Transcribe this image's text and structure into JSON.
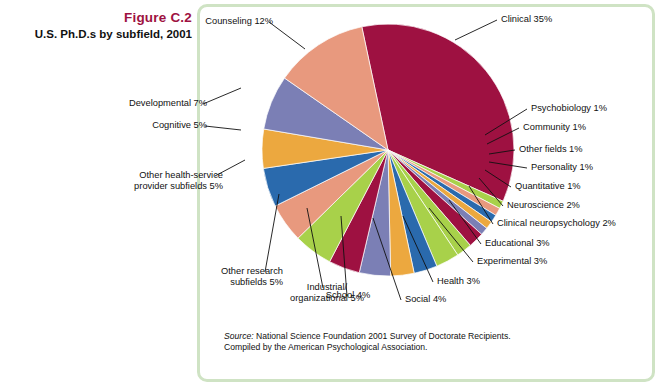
{
  "caption": {
    "figure_number": "Figure C.2",
    "title": "U.S. Ph.D.s by subfield, 2001",
    "figure_number_color": "#9e1141"
  },
  "frame": {
    "border_color": "#cfe3c4"
  },
  "source_note": {
    "label": "Source:",
    "line1": " National Science Foundation 2001 Survey of Doctorate Recipients.",
    "line2": "Compiled by the American Psychological Association."
  },
  "chart_data": {
    "type": "pie",
    "title": "U.S. Ph.D.s by subfield, 2001",
    "xlabel": "",
    "ylabel": "",
    "legend_position": "none",
    "grid": false,
    "start_angle_deg": -12,
    "direction": "clockwise",
    "units": "percent",
    "categories": [
      "Clinical",
      "Psychobiology",
      "Community",
      "Other fields",
      "Personality",
      "Quantitative",
      "Neuroscience",
      "Clinical neuropsychology",
      "Educational",
      "Experimental",
      "Health",
      "Social",
      "School",
      "Industrial/organizational",
      "Other research subfields",
      "Other health-service provider subfields",
      "Cognitive",
      "Developmental",
      "Counseling"
    ],
    "values": [
      35,
      1,
      1,
      1,
      1,
      1,
      2,
      2,
      3,
      3,
      3,
      4,
      4,
      5,
      5,
      5,
      5,
      7,
      12
    ],
    "colors": [
      "#9e1141",
      "#a8d14a",
      "#e8997e",
      "#2a6aad",
      "#eca83f",
      "#7b7fb5",
      "#9e1141",
      "#a8d14a",
      "#a8d14a",
      "#2a6aad",
      "#eca83f",
      "#7b7fb5",
      "#9e1141",
      "#a8d14a",
      "#e8997e",
      "#2a6aad",
      "#eca83f",
      "#7b7fb5",
      "#e8997e"
    ],
    "labels": [
      "Clinical 35%",
      "Psychobiology 1%",
      "Community 1%",
      "Other fields 1%",
      "Personality 1%",
      "Quantitative 1%",
      "Neuroscience 2%",
      "Clinical neuropsychology 2%",
      "Educational 3%",
      "Experimental 3%",
      "Health 3%",
      "Social 4%",
      "School 4%",
      "Industrial/organizational 5%",
      "Other research subfields 5%",
      "Other health-service provider subfields 5%",
      "Cognitive 5%",
      "Developmental 7%",
      "Counseling 12%"
    ]
  },
  "labels": {
    "clinical": "Clinical 35%",
    "psychobiology": "Psychobiology 1%",
    "community": "Community 1%",
    "other_fields": "Other fields 1%",
    "personality": "Personality 1%",
    "quantitative": "Quantitative 1%",
    "neuroscience": "Neuroscience 2%",
    "clinical_neuropsychology": "Clinical neuropsychology 2%",
    "educational": "Educational 3%",
    "experimental": "Experimental 3%",
    "health": "Health 3%",
    "social": "Social 4%",
    "school": "School 4%",
    "industrial_line1": "Industrial/",
    "industrial_line2": "organizational 5%",
    "other_research_line1": "Other research",
    "other_research_line2": "subfields 5%",
    "other_health_line1": "Other health-service",
    "other_health_line2": "provider subfields 5%",
    "cognitive": "Cognitive 5%",
    "developmental": "Developmental 7%",
    "counseling": "Counseling 12%"
  }
}
